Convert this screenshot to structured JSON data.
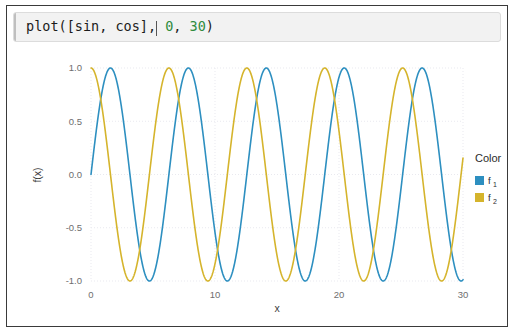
{
  "window": {
    "border_color": "#3a3a3a",
    "background": "#ffffff"
  },
  "code_cell": {
    "name": "code-input-cell",
    "background": "#f2f2f2",
    "tokens": [
      {
        "text": "plot([sin, cos],",
        "kind": "plain"
      },
      {
        "text": "caret",
        "kind": "caret"
      },
      {
        "text": " ",
        "kind": "plain"
      },
      {
        "text": "0",
        "kind": "number"
      },
      {
        "text": ", ",
        "kind": "plain"
      },
      {
        "text": "30",
        "kind": "number"
      },
      {
        "text": ")",
        "kind": "plain"
      }
    ],
    "full_text": "plot([sin, cos], 0, 30)",
    "prefix": "plot([sin, cos],",
    "num_start": "0",
    "comma_mid": ", ",
    "num_end": "30",
    "close_paren": ")",
    "space": " ",
    "number_color": "#2e8b3d"
  },
  "legend": {
    "title": "Color",
    "entries": [
      {
        "base": "f",
        "sub": "1",
        "color": "#2d8fc0"
      },
      {
        "base": "f",
        "sub": "2",
        "color": "#d5b42c"
      }
    ]
  },
  "chart_data": {
    "type": "line",
    "title": "",
    "xlabel": "x",
    "ylabel": "f(x)",
    "xlim": [
      0,
      30
    ],
    "ylim": [
      -1.0,
      1.0
    ],
    "xticks": [
      0,
      10,
      20,
      30
    ],
    "xtick_labels": [
      "0",
      "10",
      "20",
      "30"
    ],
    "yticks": [
      -1.0,
      -0.5,
      0.0,
      0.5,
      1.0
    ],
    "ytick_labels": [
      "-1.0",
      "-0.5",
      "0.0",
      "0.5",
      "1.0"
    ],
    "grid": true,
    "grid_color": "#e9e9ef",
    "legend_position": "right",
    "legend_title": "Color",
    "series": [
      {
        "name": "f1",
        "label": "f₁",
        "function": "sin",
        "color": "#2d8fc0",
        "phase": 0,
        "amplitude": 1,
        "period": 6.283185307179586
      },
      {
        "name": "f2",
        "label": "f₂",
        "function": "cos",
        "color": "#d5b42c",
        "phase": 1.5707963267948966,
        "amplitude": 1,
        "period": 6.283185307179586
      }
    ],
    "sample_points": {
      "x": [
        0,
        1.5708,
        3.1416,
        4.7124,
        6.2832,
        7.854,
        9.4248,
        10.9956,
        12.5664,
        14.1372,
        15.708,
        17.2788,
        18.8496,
        20.4204,
        21.9911,
        23.5619,
        25.1327,
        26.7035,
        28.2743,
        29.8451,
        30
      ],
      "sin": [
        0,
        1,
        0,
        -1,
        0,
        1,
        0,
        -1,
        0,
        1,
        0,
        -1,
        0,
        1,
        0,
        -1,
        0,
        1,
        0,
        -1,
        -0.988
      ],
      "cos": [
        1,
        0,
        -1,
        0,
        1,
        0,
        -1,
        0,
        1,
        0,
        -1,
        0,
        1,
        0,
        -1,
        0,
        1,
        0,
        -1,
        0,
        0.1543
      ]
    }
  }
}
